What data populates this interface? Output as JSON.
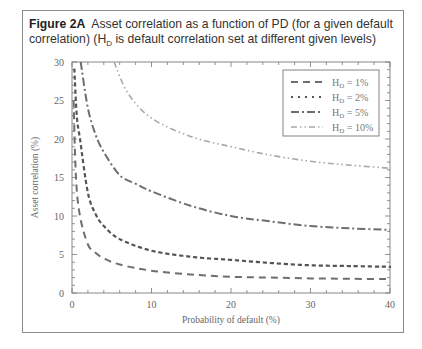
{
  "figure": {
    "label": "Figure 2A",
    "caption_line1": "Asset correlation as a function of PD (for a given default",
    "caption_line2a": "correlation) (H",
    "caption_sub": "D",
    "caption_line2b": " is default correlation set at different given levels)"
  },
  "chart_data": {
    "type": "line",
    "xlabel": "Probability of default (%)",
    "ylabel": "Asset correlation (%)",
    "xlim": [
      0,
      40
    ],
    "ylim": [
      0,
      30
    ],
    "xticks": [
      0,
      10,
      20,
      30,
      40
    ],
    "yticks": [
      0,
      5,
      10,
      15,
      20,
      25,
      30
    ],
    "grid": false,
    "legend_position": "upper right",
    "series": [
      {
        "name": "HD = 1%",
        "style": "dashed",
        "color": "#6e6e6e",
        "x": [
          0.2,
          0.5,
          1,
          2,
          3,
          4,
          6,
          10,
          15,
          20,
          25,
          30,
          35,
          40
        ],
        "y": [
          25,
          15,
          10,
          6.3,
          5.2,
          4.5,
          3.7,
          2.9,
          2.4,
          2.1,
          2.0,
          1.9,
          1.85,
          1.8
        ]
      },
      {
        "name": "HD = 2%",
        "style": "dotted",
        "color": "#555555",
        "x": [
          0.3,
          0.6,
          1,
          2,
          3,
          4,
          6,
          10,
          15,
          20,
          25,
          30,
          35,
          40
        ],
        "y": [
          29,
          23,
          20,
          13,
          10.2,
          8.7,
          7,
          5.5,
          4.7,
          4.3,
          3.9,
          3.6,
          3.5,
          3.4
        ]
      },
      {
        "name": "HD = 5%",
        "style": "dash-dot",
        "color": "#6e6e6e",
        "x": [
          1.1,
          2,
          3,
          4,
          6,
          8,
          10,
          15,
          20,
          25,
          30,
          35,
          40
        ],
        "y": [
          30,
          24,
          20.5,
          18.3,
          15.3,
          14.2,
          13.2,
          11.3,
          10,
          9.3,
          8.7,
          8.4,
          8.2
        ]
      },
      {
        "name": "HD = 10%",
        "style": "dash-dot-dot",
        "color": "#a8a8a8",
        "x": [
          5.3,
          7,
          10,
          15,
          20,
          25,
          30,
          35,
          40
        ],
        "y": [
          30,
          26,
          22.7,
          20.3,
          19,
          17.9,
          17.1,
          16.6,
          16.2
        ]
      }
    ]
  },
  "axes": {
    "x_ticks": [
      "0",
      "10",
      "20",
      "30",
      "40"
    ],
    "y_ticks": [
      "0",
      "5",
      "10",
      "15",
      "20",
      "25",
      "30"
    ],
    "x_title": "Probability of default (%)",
    "y_title": "Asset correlation (%)"
  },
  "legend": {
    "items": [
      {
        "prefix": "H",
        "sub": "D",
        "suffix": " = 1%"
      },
      {
        "prefix": "H",
        "sub": "D",
        "suffix": " = 2%"
      },
      {
        "prefix": "H",
        "sub": "D",
        "suffix": " = 5%"
      },
      {
        "prefix": "H",
        "sub": "D",
        "suffix": " = 10%"
      }
    ]
  }
}
